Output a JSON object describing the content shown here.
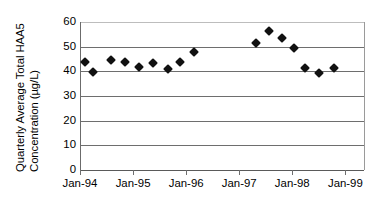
{
  "chart_data": {
    "type": "scatter",
    "title": "",
    "xlabel": "",
    "ylabel": "Quarterly Average Total HAA5 Concentration (µg/L)",
    "ylabel_lines": [
      "Quarterly Average Total HAA5",
      "Concentration (µg/L)"
    ],
    "ylim": [
      0,
      60
    ],
    "y_ticks": [
      0,
      10,
      20,
      30,
      40,
      50,
      60
    ],
    "y_tick_labels": [
      "0",
      "10",
      "20",
      "30",
      "40",
      "50",
      "60"
    ],
    "x_tick_labels": [
      "Jan-94",
      "Jan-95",
      "Jan-96",
      "Jan-97",
      "Jan-98",
      "Jan-99"
    ],
    "x_tick_values": [
      1994.0,
      1995.0,
      1996.0,
      1997.0,
      1998.0,
      1999.0
    ],
    "xlim": [
      1994.0,
      1999.37
    ],
    "grid": true,
    "legend": false,
    "marker": "diamond",
    "marker_color": "#111111",
    "series": [
      {
        "name": "Quarterly Average Total HAA5",
        "x": [
          1994.08,
          1994.23,
          1994.57,
          1994.83,
          1995.09,
          1995.35,
          1995.63,
          1995.87,
          1996.13,
          1996.38,
          1997.3,
          1997.55,
          1997.79,
          1998.01,
          1998.23,
          1998.48,
          1998.77
        ],
        "values": [
          43.6,
          39.7,
          44.7,
          43.6,
          41.7,
          43.5,
          40.8,
          43.6,
          47.8,
          51.5,
          51.5,
          56.2,
          53.4,
          49.5,
          41.3,
          39.4,
          41.4
        ],
        "labels": [
          "Jan-94 Q1",
          "Apr-94",
          "Jul-94",
          "Oct-94",
          "Jan-95",
          "Apr-95",
          "Jul-95",
          "Oct-95",
          "Jan-96",
          "Apr-96",
          "Apr-97",
          "Jul-97",
          "Oct-97",
          "Jan-98",
          "Apr-98",
          "Jul-98",
          "Oct-98"
        ]
      }
    ],
    "points": [
      {
        "x": 1994.08,
        "y": 43.6
      },
      {
        "x": 1994.23,
        "y": 39.7
      },
      {
        "x": 1994.57,
        "y": 44.7
      },
      {
        "x": 1994.83,
        "y": 43.6
      },
      {
        "x": 1995.09,
        "y": 41.7
      },
      {
        "x": 1995.35,
        "y": 43.5
      },
      {
        "x": 1995.63,
        "y": 40.8
      },
      {
        "x": 1995.87,
        "y": 43.6
      },
      {
        "x": 1996.13,
        "y": 47.8
      },
      {
        "x": 1997.3,
        "y": 51.5
      },
      {
        "x": 1997.55,
        "y": 56.2
      },
      {
        "x": 1997.79,
        "y": 53.4
      },
      {
        "x": 1998.01,
        "y": 49.5
      },
      {
        "x": 1998.23,
        "y": 41.3
      },
      {
        "x": 1998.48,
        "y": 39.4
      },
      {
        "x": 1998.77,
        "y": 41.4
      }
    ]
  },
  "colors": {
    "marker": "#111111",
    "gridline": "#6e6e6e",
    "axis": "#5a5a5a",
    "background": "#ffffff"
  }
}
